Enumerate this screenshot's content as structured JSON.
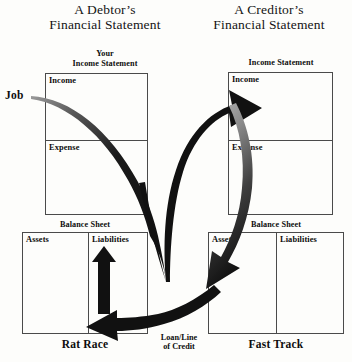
{
  "diagram": {
    "title_left_line1": "A Debtor’s",
    "title_left_line2": "Financial Statement",
    "title_right_line1": "A Creditor’s",
    "title_right_line2": "Financial Statement",
    "left": {
      "income_statement_caption_line1": "Your",
      "income_statement_caption_line2": "Income Statement",
      "income_label": "Income",
      "expense_label": "Expense",
      "balance_sheet_caption": "Balance Sheet",
      "assets_label": "Assets",
      "liabilities_label": "Liabilities",
      "footer_label": "Rat Race"
    },
    "right": {
      "income_statement_caption": "Income Statement",
      "income_label": "Income",
      "expense_label": "Expense",
      "balance_sheet_caption": "Balance Sheet",
      "assets_label": "Assets",
      "liabilities_label": "Liabilities",
      "footer_label": "Fast Track"
    },
    "job_label": "Job",
    "center_label_line1": "Loan/Line",
    "center_label_line2": "of Credit",
    "colors": {
      "background": "#fdfdfb",
      "ink": "#0d0d0d",
      "box_stroke": "#4a4a4a",
      "arrow_fill": "#111111",
      "arrow_fade": "#6f6f6f"
    }
  }
}
